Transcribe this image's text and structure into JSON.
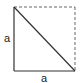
{
  "diagram": {
    "left_label": "a",
    "bottom_label": "a",
    "colors": {
      "stroke": "#333333",
      "dashed": "#666666"
    }
  }
}
